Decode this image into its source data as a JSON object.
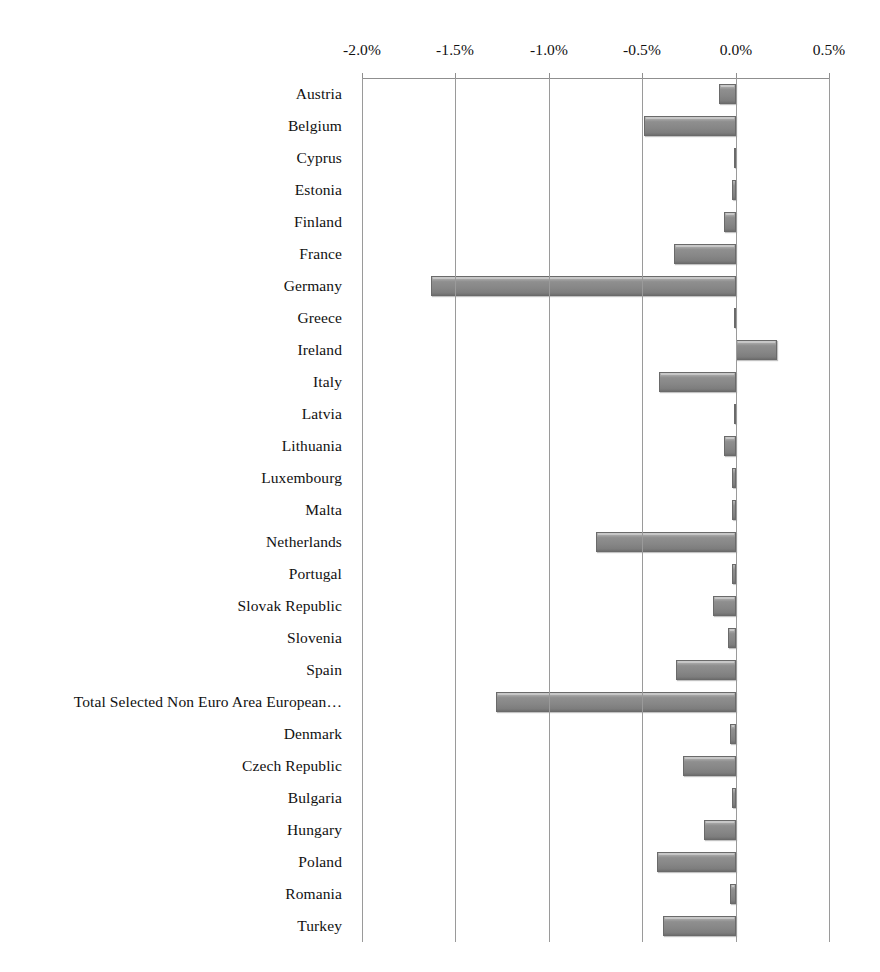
{
  "chart_data": {
    "type": "bar",
    "orientation": "horizontal",
    "title": "",
    "subtitle": "",
    "xlabel": "",
    "ylabel": "",
    "grid": true,
    "legend": false,
    "xlim": [
      -2.0,
      0.5
    ],
    "xtick_labels": [
      "-2.0%",
      "-1.5%",
      "-1.0%",
      "-0.5%",
      "0.0%",
      "0.5%"
    ],
    "xticks": [
      -2.0,
      -1.5,
      -1.0,
      -0.5,
      0.0,
      0.5
    ],
    "unit": "%",
    "categories": [
      "Austria",
      "Belgium",
      "Cyprus",
      "Estonia",
      "Finland",
      "France",
      "Germany",
      "Greece",
      "Ireland",
      "Italy",
      "Latvia",
      "Lithuania",
      "Luxembourg",
      "Malta",
      "Netherlands",
      "Portugal",
      "Slovak Republic",
      "Slovenia",
      "Spain",
      "Total Selected Non Euro Area European…",
      "Denmark",
      "Czech Republic",
      "Bulgaria",
      "Hungary",
      "Poland",
      "Romania",
      "Turkey"
    ],
    "values": [
      -0.09,
      -0.49,
      -0.01,
      -0.02,
      -0.06,
      -0.33,
      -1.63,
      -0.01,
      0.22,
      -0.41,
      -0.01,
      -0.06,
      -0.02,
      -0.02,
      -0.75,
      -0.02,
      -0.12,
      -0.04,
      -0.32,
      -1.28,
      -0.03,
      -0.28,
      -0.02,
      -0.17,
      -0.42,
      -0.03,
      -0.39
    ],
    "colors": {
      "bar_fill": "#8f8f8f",
      "bar_highlight": "#b9b9b9",
      "bar_edge": "#6a6a6a",
      "gridline": "#9a9a9a",
      "axis": "#8f8f8f",
      "text": "#111111",
      "background": "#ffffff"
    }
  }
}
